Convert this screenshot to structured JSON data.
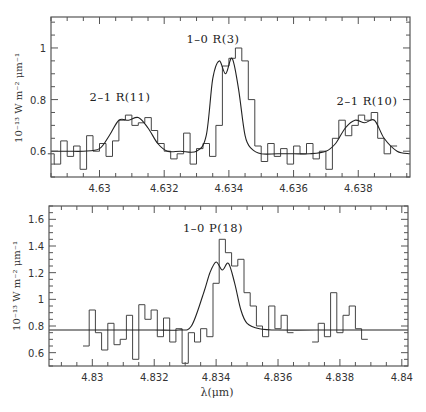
{
  "chart_data": [
    {
      "type": "line",
      "panel": "top",
      "title": "",
      "xlabel": "",
      "ylabel": "10⁻¹³ W m⁻² μm⁻¹",
      "xlim": [
        4.6285,
        4.6396
      ],
      "ylim": [
        0.5,
        1.12
      ],
      "xticks": [
        4.63,
        4.632,
        4.634,
        4.636,
        4.638
      ],
      "xtick_labels": [
        "4.63",
        "4.632",
        "4.634",
        "4.636",
        "4.638"
      ],
      "yticks": [
        0.6,
        0.8,
        1.0
      ],
      "ytick_labels": [
        "0.6",
        "0.8",
        "1"
      ],
      "grid": false,
      "annotations": [
        {
          "text": "2-1 R(11)",
          "x": 4.6305,
          "y": 0.79
        },
        {
          "text": "1-0 R(3)",
          "x": 4.6338,
          "y": 1.06
        },
        {
          "text": "2-1 R(10)",
          "x": 4.6383,
          "y": 0.79
        }
      ],
      "series": [
        {
          "name": "observed spectrum (histogram)",
          "x": [
            4.6285,
            4.6287,
            4.6289,
            4.6291,
            4.6293,
            4.6295,
            4.6297,
            4.6299,
            4.6301,
            4.6303,
            4.6305,
            4.6307,
            4.6309,
            4.6311,
            4.6313,
            4.6315,
            4.6317,
            4.6319,
            4.6321,
            4.6323,
            4.6325,
            4.6327,
            4.6329,
            4.6331,
            4.6333,
            4.6335,
            4.6337,
            4.6339,
            4.6341,
            4.6343,
            4.6345,
            4.6347,
            4.6349,
            4.6351,
            4.6353,
            4.6355,
            4.6357,
            4.6359,
            4.6361,
            4.6363,
            4.6365,
            4.6367,
            4.6369,
            4.6371,
            4.6373,
            4.6375,
            4.6377,
            4.6379,
            4.6381,
            4.6383,
            4.6385,
            4.6387,
            4.6389,
            4.6391
          ],
          "y": [
            0.59,
            0.55,
            0.64,
            0.58,
            0.62,
            0.53,
            0.66,
            0.6,
            0.63,
            0.58,
            0.64,
            0.72,
            0.74,
            0.7,
            0.71,
            0.73,
            0.68,
            0.63,
            0.6,
            0.57,
            0.59,
            0.67,
            0.55,
            0.61,
            0.63,
            0.58,
            0.7,
            0.93,
            0.96,
            1.0,
            0.95,
            0.8,
            0.62,
            0.56,
            0.63,
            0.58,
            0.61,
            0.55,
            0.62,
            0.59,
            0.63,
            0.57,
            0.6,
            0.53,
            0.65,
            0.72,
            0.66,
            0.7,
            0.74,
            0.72,
            0.75,
            0.65,
            0.59,
            0.62
          ]
        },
        {
          "name": "model fit",
          "x": [
            4.6285,
            4.629,
            4.6295,
            4.63,
            4.6303,
            4.6306,
            4.6309,
            4.6312,
            4.6315,
            4.6318,
            4.6321,
            4.6325,
            4.633,
            4.6333,
            4.6335,
            4.6337,
            4.6339,
            4.6341,
            4.6343,
            4.6345,
            4.6347,
            4.635,
            4.6355,
            4.636,
            4.6365,
            4.637,
            4.6373,
            4.6376,
            4.6379,
            4.6382,
            4.6385,
            4.6388,
            4.6392,
            4.6396
          ],
          "y": [
            0.6,
            0.6,
            0.6,
            0.61,
            0.66,
            0.72,
            0.72,
            0.73,
            0.69,
            0.63,
            0.6,
            0.6,
            0.6,
            0.66,
            0.88,
            0.95,
            0.9,
            0.96,
            0.84,
            0.66,
            0.61,
            0.59,
            0.59,
            0.59,
            0.59,
            0.6,
            0.63,
            0.69,
            0.72,
            0.71,
            0.72,
            0.65,
            0.6,
            0.59
          ]
        }
      ]
    },
    {
      "type": "line",
      "panel": "bottom",
      "title": "",
      "xlabel": "λ(μm)",
      "ylabel": "10⁻¹³ W m⁻² μm⁻¹",
      "xlim": [
        4.8286,
        4.8402
      ],
      "ylim": [
        0.5,
        1.7
      ],
      "xticks": [
        4.83,
        4.832,
        4.834,
        4.836,
        4.838,
        4.84
      ],
      "xtick_labels": [
        "4.83",
        "4.832",
        "4.834",
        "4.836",
        "4.838",
        "4.84"
      ],
      "yticks": [
        0.6,
        0.8,
        1.0,
        1.2,
        1.4,
        1.6
      ],
      "ytick_labels": [
        "0.6",
        "0.8",
        "1",
        "1.2",
        "1.4",
        "1.6"
      ],
      "grid": false,
      "annotations": [
        {
          "text": "1-0 P(18)",
          "x": 4.834,
          "y": 1.53
        }
      ],
      "series": [
        {
          "name": "observed spectrum (histogram)",
          "x": [
            4.8298,
            4.83,
            4.8302,
            4.8304,
            4.8306,
            4.8308,
            4.831,
            4.8312,
            4.8314,
            4.8316,
            4.8318,
            4.832,
            4.8322,
            4.8324,
            4.8326,
            4.8328,
            4.833,
            4.8332,
            4.8334,
            4.8336,
            4.8338,
            4.834,
            4.8342,
            4.8344,
            4.8346,
            4.8348,
            4.835,
            4.8352,
            4.8354,
            4.8356,
            4.8358,
            4.836,
            4.8362,
            4.8364,
            4.8372,
            4.8374,
            4.8376,
            4.8378,
            4.838,
            4.8382,
            4.8384,
            4.8386,
            4.8388
          ],
          "y": [
            0.65,
            0.92,
            0.75,
            0.62,
            0.82,
            0.66,
            0.7,
            0.88,
            0.55,
            0.96,
            0.85,
            0.92,
            0.72,
            0.86,
            0.68,
            0.78,
            0.52,
            0.75,
            0.68,
            0.78,
            0.72,
            1.12,
            1.45,
            1.35,
            1.25,
            1.3,
            1.05,
            0.95,
            0.8,
            0.72,
            0.95,
            0.78,
            0.88,
            0.75,
            0.68,
            0.82,
            0.72,
            1.05,
            0.75,
            0.88,
            0.95,
            0.78,
            0.7
          ]
        },
        {
          "name": "model fit",
          "x": [
            4.8286,
            4.83,
            4.831,
            4.832,
            4.8328,
            4.8332,
            4.8336,
            4.8338,
            4.834,
            4.8342,
            4.8344,
            4.8346,
            4.8348,
            4.835,
            4.8354,
            4.836,
            4.838,
            4.8402
          ],
          "y": [
            0.77,
            0.77,
            0.77,
            0.77,
            0.77,
            0.8,
            1.05,
            1.2,
            1.28,
            1.22,
            1.27,
            1.12,
            0.92,
            0.82,
            0.78,
            0.77,
            0.77,
            0.77
          ]
        }
      ]
    }
  ],
  "labels": {
    "top_ylabel": "10⁻¹³ W m⁻² μm⁻¹",
    "bottom_ylabel": "10⁻¹³ W m⁻² μm⁻¹",
    "xlabel": "λ(μm)",
    "top_ann_left": "2–1 R(11)",
    "top_ann_center": "1–0 R(3)",
    "top_ann_right": "2–1 R(10)",
    "bottom_ann_center": "1–0 P(18)"
  }
}
